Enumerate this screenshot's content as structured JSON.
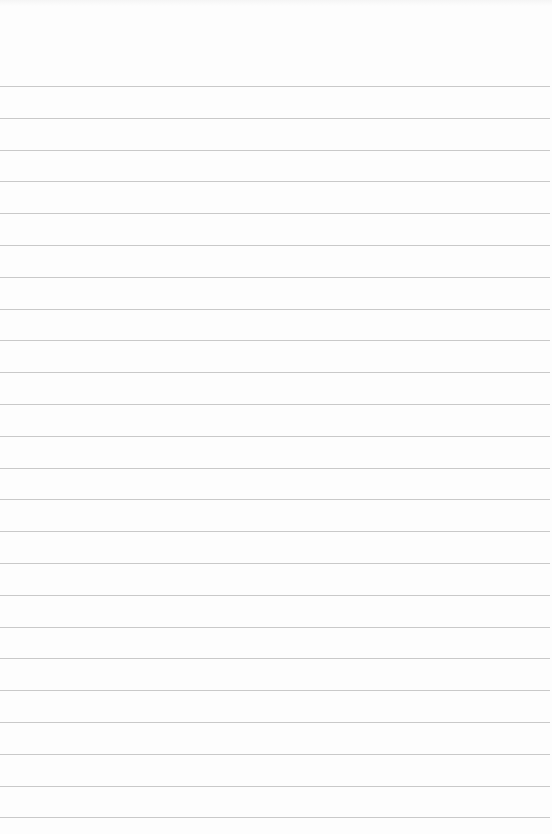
{
  "page": {
    "type": "blank-ruled-paper",
    "background_color": "#fdfdfd",
    "rule_color": "#c9c9c9",
    "rule_count": 24,
    "first_rule_y": 86,
    "rule_spacing": 31.8,
    "rule_width": 550
  }
}
